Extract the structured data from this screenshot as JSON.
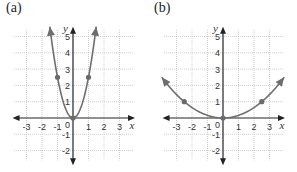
{
  "chart_data": [
    {
      "type": "line",
      "title": "(a)",
      "xlabel": "x",
      "ylabel": "y",
      "xlim": [
        -3.5,
        3.5
      ],
      "ylim": [
        -2.5,
        5.5
      ],
      "x_ticks": [
        "-3",
        "-2",
        "-1",
        "1",
        "2",
        "3"
      ],
      "y_ticks": [
        "5",
        "4",
        "3",
        "2",
        "1",
        "-1",
        "-2"
      ],
      "origin_label": "0",
      "grid": true,
      "function": "y = 2.5x^2",
      "coefficient": 2.5,
      "points": [
        {
          "x": -1,
          "y": 2.5
        },
        {
          "x": 0,
          "y": 0
        },
        {
          "x": 1,
          "y": 2.5
        }
      ],
      "curve_color": "#6e6e6e"
    },
    {
      "type": "line",
      "title": "(b)",
      "xlabel": "x",
      "ylabel": "y",
      "xlim": [
        -3.5,
        3.5
      ],
      "ylim": [
        -2.5,
        5.5
      ],
      "x_ticks": [
        "-3",
        "-2",
        "-1",
        "1",
        "2",
        "3"
      ],
      "y_ticks": [
        "5",
        "4",
        "3",
        "2",
        "1",
        "-1",
        "-2"
      ],
      "origin_label": "0",
      "grid": true,
      "function": "y = 0.16x^2",
      "coefficient": 0.16,
      "points": [
        {
          "x": -2.5,
          "y": 1
        },
        {
          "x": 0,
          "y": 0
        },
        {
          "x": 2.5,
          "y": 1
        }
      ],
      "curve_color": "#6e6e6e"
    }
  ],
  "panels": {
    "a": {
      "label": "(a)"
    },
    "b": {
      "label": "(b)"
    }
  }
}
